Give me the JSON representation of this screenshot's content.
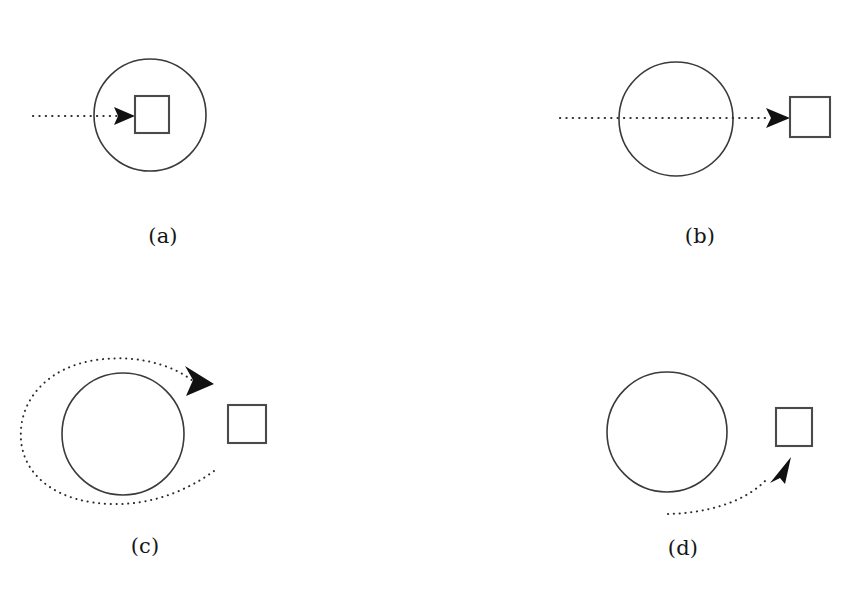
{
  "figure": {
    "title": "",
    "background_color": "#ffffff",
    "stroke_color": "#3a3a3a",
    "arrow_color": "#111111",
    "caption_color": "#161616",
    "panels": [
      {
        "id": "a",
        "caption": "(a)",
        "caption_x": 163,
        "caption_y": 243,
        "description": "dotted arrow from left terminating on a square located inside the circle",
        "circle": {
          "cx": 150,
          "cy": 115,
          "r": 56
        },
        "square": {
          "x": 135,
          "y": 96,
          "size": 34,
          "inside_circle": true
        },
        "arrow": {
          "kind": "straight",
          "dotted_from_x": 33,
          "dotted_to_x": 118,
          "y": 116,
          "head_x": 135,
          "head_y": 116,
          "direction": "right"
        }
      },
      {
        "id": "b",
        "caption": "(b)",
        "caption_x": 700,
        "caption_y": 243,
        "description": "dotted line passes straight through the circle and terminates on a square outside to the right",
        "circle": {
          "cx": 676,
          "cy": 119,
          "r": 57
        },
        "square": {
          "x": 790,
          "y": 97,
          "size": 40,
          "inside_circle": false
        },
        "arrow": {
          "kind": "straight",
          "dotted_from_x": 560,
          "dotted_to_x": 772,
          "y": 118,
          "head_x": 790,
          "head_y": 118,
          "direction": "right"
        }
      },
      {
        "id": "c",
        "caption": "(c)",
        "caption_x": 145,
        "caption_y": 553,
        "description": "dotted path loops counter-clockwise around the circle and ends with an arrowhead aimed down-right at the square outside",
        "circle": {
          "cx": 123,
          "cy": 434,
          "r": 61
        },
        "square": {
          "x": 228,
          "y": 405,
          "size": 38,
          "inside_circle": false
        },
        "arrow": {
          "kind": "loop",
          "head_x": 212,
          "head_y": 381,
          "direction": "down-right",
          "loop_direction": "counter-clockwise"
        }
      },
      {
        "id": "d",
        "caption": "(d)",
        "caption_x": 683,
        "caption_y": 555,
        "description": "dotted curve rises from lower-left, bypassing the circle, ending with an arrowhead aimed up-right below the square",
        "circle": {
          "cx": 667,
          "cy": 432,
          "r": 60
        },
        "square": {
          "x": 776,
          "y": 408,
          "size": 36,
          "inside_circle": false
        },
        "arrow": {
          "kind": "curve",
          "start_x": 668,
          "start_y": 514,
          "head_x": 789,
          "head_y": 464,
          "direction": "up-right"
        }
      }
    ]
  }
}
